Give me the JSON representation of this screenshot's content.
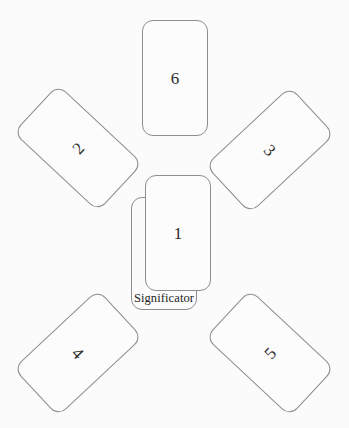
{
  "layout": {
    "name": "six-card-spread-with-significator",
    "width": 349,
    "height": 428,
    "background_color": "#fbfbfb",
    "card_border_color": "#8f8d90",
    "card_face_color": "#fcfcfc",
    "numeral_color": "#2b2b2b"
  },
  "cards": [
    {
      "id": "card-6",
      "label": "6",
      "position": "top-center",
      "rotation_deg": 0
    },
    {
      "id": "card-2",
      "label": "2",
      "position": "upper-left",
      "rotation_deg": -47
    },
    {
      "id": "card-3",
      "label": "3",
      "position": "upper-right",
      "rotation_deg": 47
    },
    {
      "id": "card-1",
      "label": "1",
      "position": "center",
      "rotation_deg": 0
    },
    {
      "id": "card-4",
      "label": "4",
      "position": "lower-left",
      "rotation_deg": 47
    },
    {
      "id": "card-5",
      "label": "5",
      "position": "lower-right",
      "rotation_deg": -47
    }
  ],
  "significator": {
    "id": "card-significator",
    "label": "Significator",
    "position": "center-behind-card-1",
    "rotation_deg": 0
  }
}
